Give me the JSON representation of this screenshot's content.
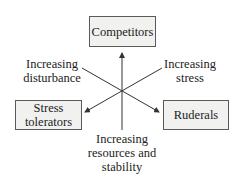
{
  "diagram": {
    "nodes": {
      "competitors": "Competitors",
      "stress_tolerators_line1": "Stress",
      "stress_tolerators_line2": "tolerators",
      "ruderals": "Ruderals"
    },
    "axes": {
      "disturbance_line1": "Increasing",
      "disturbance_line2": "disturbance",
      "stress_line1": "Increasing",
      "stress_line2": "stress",
      "resources_line1": "Increasing",
      "resources_line2": "resources and",
      "resources_line3": "stability"
    },
    "colors": {
      "box_fill": "#f1f1ef",
      "box_border": "#5a5a5a",
      "line": "#333333"
    }
  }
}
